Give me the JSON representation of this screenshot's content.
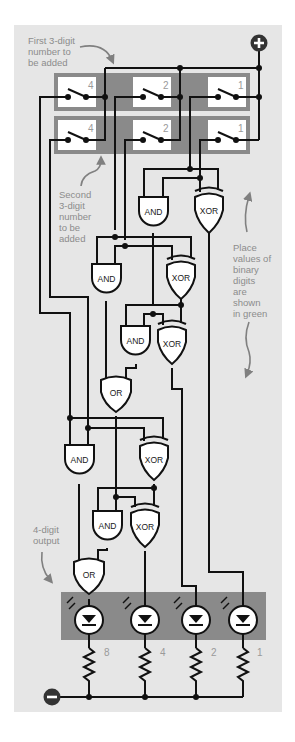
{
  "diagram": {
    "colors": {
      "panel_bg": "#e6e6e6",
      "switch_bank_bg": "#8a8a8a",
      "led_bank_bg": "#8a8a8a",
      "wire": "#111111",
      "annotation_text": "#8c8c8c",
      "place_value_text": "#9a9a9a",
      "terminal": "#333333"
    },
    "annotations": {
      "first_number": [
        "First 3-digit",
        "number to",
        "be added"
      ],
      "second_number": [
        "Second",
        "3-digit",
        "number",
        "to be",
        "added"
      ],
      "place_values": [
        "Place",
        "values of",
        "binary",
        "digits",
        "are",
        "shown",
        "in green"
      ],
      "output": [
        "4-digit",
        "output"
      ]
    },
    "terminals": {
      "positive": "+",
      "negative": "−"
    },
    "first_number_switches": [
      {
        "place_value": "4"
      },
      {
        "place_value": "2"
      },
      {
        "place_value": "1"
      }
    ],
    "second_number_switches": [
      {
        "place_value": "4"
      },
      {
        "place_value": "2"
      },
      {
        "place_value": "1"
      }
    ],
    "gates": [
      {
        "id": "and1",
        "type": "AND"
      },
      {
        "id": "xor1",
        "type": "XOR"
      },
      {
        "id": "and2",
        "type": "AND"
      },
      {
        "id": "xor2",
        "type": "XOR"
      },
      {
        "id": "and3",
        "type": "AND"
      },
      {
        "id": "xor3",
        "type": "XOR"
      },
      {
        "id": "or1",
        "type": "OR"
      },
      {
        "id": "and4",
        "type": "AND"
      },
      {
        "id": "xor4",
        "type": "XOR"
      },
      {
        "id": "and5",
        "type": "AND"
      },
      {
        "id": "xor5",
        "type": "XOR"
      },
      {
        "id": "or2",
        "type": "OR"
      }
    ],
    "output_leds": [
      {
        "place_value": "8"
      },
      {
        "place_value": "4"
      },
      {
        "place_value": "2"
      },
      {
        "place_value": "1"
      }
    ]
  }
}
